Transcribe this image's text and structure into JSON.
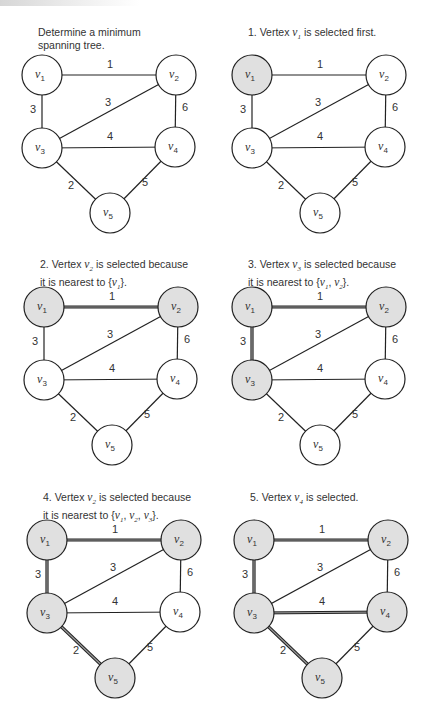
{
  "figure": {
    "graph": {
      "vertices": [
        "v1",
        "v2",
        "v3",
        "v4",
        "v5"
      ],
      "edges": [
        {
          "id": "v1-v2",
          "from": "v1",
          "to": "v2",
          "weight": "1"
        },
        {
          "id": "v1-v3",
          "from": "v1",
          "to": "v3",
          "weight": "3"
        },
        {
          "id": "v2-v3",
          "from": "v2",
          "to": "v3",
          "weight": "3"
        },
        {
          "id": "v2-v4",
          "from": "v2",
          "to": "v4",
          "weight": "6"
        },
        {
          "id": "v3-v4",
          "from": "v3",
          "to": "v4",
          "weight": "4"
        },
        {
          "id": "v3-v5",
          "from": "v3",
          "to": "v5",
          "weight": "2"
        },
        {
          "id": "v4-v5",
          "from": "v4",
          "to": "v5",
          "weight": "5"
        }
      ]
    },
    "panels": [
      {
        "caption": [
          [
            {
              "t": "Determine a minimum"
            }
          ],
          [
            {
              "t": "spanning tree."
            }
          ]
        ],
        "selected_vertices": [],
        "selected_edges": []
      },
      {
        "caption": [
          [
            {
              "t": "1. Vertex "
            },
            {
              "v": "v",
              "s": "1"
            },
            {
              "t": " is selected first."
            }
          ]
        ],
        "selected_vertices": [
          "v1"
        ],
        "selected_edges": []
      },
      {
        "caption": [
          [
            {
              "t": "2. Vertex "
            },
            {
              "v": "v",
              "s": "2"
            },
            {
              "t": " is selected because"
            }
          ],
          [
            {
              "t": "it is nearest to {"
            },
            {
              "v": "v",
              "s": "1"
            },
            {
              "t": "}."
            }
          ]
        ],
        "selected_vertices": [
          "v1",
          "v2"
        ],
        "selected_edges": [
          "v1-v2"
        ]
      },
      {
        "caption": [
          [
            {
              "t": "3. Vertex "
            },
            {
              "v": "v",
              "s": "3"
            },
            {
              "t": " is selected because"
            }
          ],
          [
            {
              "t": "it is nearest to {"
            },
            {
              "v": "v",
              "s": "1"
            },
            {
              "t": ", "
            },
            {
              "v": "v",
              "s": "2"
            },
            {
              "t": "}."
            }
          ]
        ],
        "selected_vertices": [
          "v1",
          "v2",
          "v3"
        ],
        "selected_edges": [
          "v1-v2",
          "v1-v3"
        ]
      },
      {
        "caption": [
          [
            {
              "t": "4. Vertex "
            },
            {
              "v": "v",
              "s": "2"
            },
            {
              "t": " is selected because"
            }
          ],
          [
            {
              "t": "it is nearest to {"
            },
            {
              "v": "v",
              "s": "1"
            },
            {
              "t": ", "
            },
            {
              "v": "v",
              "s": "2"
            },
            {
              "t": ", "
            },
            {
              "v": "v",
              "s": "3"
            },
            {
              "t": "}."
            }
          ]
        ],
        "selected_vertices": [
          "v1",
          "v2",
          "v3",
          "v5"
        ],
        "selected_edges": [
          "v1-v2",
          "v1-v3",
          "v3-v5"
        ]
      },
      {
        "caption": [
          [
            {
              "t": "5. Vertex "
            },
            {
              "v": "v",
              "s": "4"
            },
            {
              "t": " is selected."
            }
          ]
        ],
        "selected_vertices": [
          "v1",
          "v2",
          "v3",
          "v4",
          "v5"
        ],
        "selected_edges": [
          "v1-v2",
          "v1-v3",
          "v3-v5",
          "v3-v4"
        ]
      }
    ],
    "colors": {
      "selected_fill": "#e0e0e0",
      "unselected_fill": "#ffffff",
      "stroke": "#222222",
      "selected_edge_core": "#9a9a9a"
    }
  }
}
